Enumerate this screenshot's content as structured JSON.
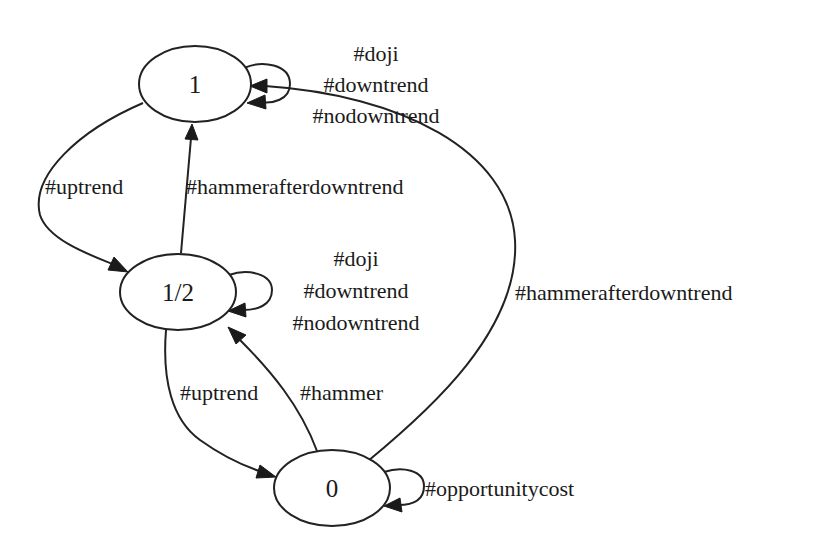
{
  "diagram": {
    "type": "state-machine",
    "nodes": [
      {
        "id": "n1",
        "label": "1"
      },
      {
        "id": "nhalf",
        "label": "1/2"
      },
      {
        "id": "n0",
        "label": "0"
      }
    ],
    "edges": [
      {
        "from": "1",
        "to": "1",
        "labels": [
          "#doji",
          "#downtrend",
          "#nodowntrend"
        ]
      },
      {
        "from": "1",
        "to": "1/2",
        "labels": [
          "#uptrend"
        ]
      },
      {
        "from": "1/2",
        "to": "1",
        "labels": [
          "#hammerafterdowntrend"
        ]
      },
      {
        "from": "1/2",
        "to": "1/2",
        "labels": [
          "#doji",
          "#downtrend",
          "#nodowntrend"
        ]
      },
      {
        "from": "1/2",
        "to": "0",
        "labels": [
          "#uptrend"
        ]
      },
      {
        "from": "0",
        "to": "1/2",
        "labels": [
          "#hammer"
        ]
      },
      {
        "from": "0",
        "to": "1",
        "labels": [
          "#hammerafterdowntrend"
        ]
      },
      {
        "from": "0",
        "to": "0",
        "labels": [
          "#opportunitycost"
        ]
      }
    ]
  },
  "colors": {
    "background": "#ffffff",
    "stroke": "#222222",
    "text": "#1a1a1a"
  }
}
